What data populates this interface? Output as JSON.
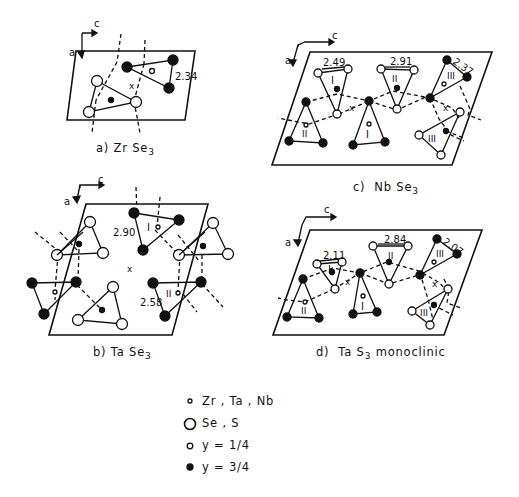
{
  "figure": {
    "panels": [
      {
        "id": "a",
        "caption_prefix": "a)",
        "compound": "Zr Se",
        "subscript": "3",
        "suffix": "",
        "bond_labels": [
          "2.34"
        ],
        "axis_labels": {
          "a": "a",
          "c": "c"
        }
      },
      {
        "id": "b",
        "caption_prefix": "b)",
        "compound": "Ta Se",
        "subscript": "3",
        "suffix": "",
        "bond_labels": [
          "2.90",
          "2.58"
        ],
        "chain_labels": [
          "I",
          "II"
        ],
        "axis_labels": {
          "a": "a",
          "c": "c"
        }
      },
      {
        "id": "c",
        "caption_prefix": "c)",
        "compound": "Nb Se",
        "subscript": "3",
        "suffix": "",
        "bond_labels": [
          "2.49",
          "2.91",
          "2.37"
        ],
        "chain_labels": [
          "I",
          "II",
          "III",
          "II",
          "I",
          "III"
        ],
        "axis_labels": {
          "a": "a",
          "c": "c"
        }
      },
      {
        "id": "d",
        "caption_prefix": "d)",
        "compound": "Ta S",
        "subscript": "3",
        "suffix": " monoclinic",
        "bond_labels": [
          "2.11",
          "2.84",
          "2.07"
        ],
        "chain_labels": [
          "I",
          "II",
          "III",
          "II",
          "I",
          "III"
        ],
        "axis_labels": {
          "a": "a",
          "c": "c"
        }
      }
    ],
    "center_marker": "x",
    "legend": [
      {
        "symbol": "small-open-circle",
        "label": "Zr , Ta , Nb"
      },
      {
        "symbol": "large-open-circle",
        "label": "Se , S"
      },
      {
        "symbol": "medium-open-circle",
        "label": "y = 1/4"
      },
      {
        "symbol": "filled-circle",
        "label": "y = 3/4"
      }
    ]
  }
}
